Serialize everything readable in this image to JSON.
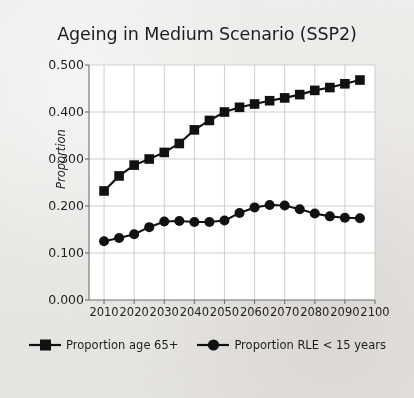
{
  "figure": {
    "background_color": "#ebe9e6",
    "plot_background_color": "#ffffff",
    "ink_color": "#111111",
    "grid_color": "#c9c9c9"
  },
  "chart_data": {
    "type": "line",
    "title": "Ageing in Medium Scenario (SSP2)",
    "xlabel": "",
    "ylabel": "Proportion",
    "xlim": [
      2005,
      2100
    ],
    "ylim": [
      0.0,
      0.5
    ],
    "xticks": [
      2010,
      2020,
      2030,
      2040,
      2050,
      2060,
      2070,
      2080,
      2090,
      2100
    ],
    "xtick_labels": [
      "2010",
      "2020",
      "2030",
      "2040",
      "2050",
      "2060",
      "2070",
      "2080",
      "2090",
      "2100"
    ],
    "yticks": [
      0.0,
      0.1,
      0.2,
      0.3,
      0.4,
      0.5
    ],
    "ytick_labels": [
      "0.000",
      "0.100",
      "0.200",
      "0.300",
      "0.400",
      "0.500"
    ],
    "grid": true,
    "legend_position": "below",
    "x": [
      2010,
      2015,
      2020,
      2025,
      2030,
      2035,
      2040,
      2045,
      2050,
      2055,
      2060,
      2065,
      2070,
      2075,
      2080,
      2085,
      2090,
      2095
    ],
    "series": [
      {
        "name": "Proportion age 65+",
        "marker": "square",
        "color": "#111111",
        "values": [
          0.232,
          0.264,
          0.287,
          0.3,
          0.314,
          0.333,
          0.362,
          0.382,
          0.4,
          0.41,
          0.417,
          0.424,
          0.43,
          0.437,
          0.446,
          0.452,
          0.46,
          0.468
        ]
      },
      {
        "name": "Proportion RLE < 15 years",
        "marker": "circle",
        "color": "#111111",
        "values": [
          0.125,
          0.132,
          0.14,
          0.155,
          0.167,
          0.168,
          0.166,
          0.166,
          0.169,
          0.185,
          0.197,
          0.202,
          0.201,
          0.193,
          0.184,
          0.178,
          0.175,
          0.174
        ]
      }
    ]
  },
  "legend": {
    "entries": [
      {
        "label": "Proportion age 65+",
        "marker": "square"
      },
      {
        "label": "Proportion RLE < 15 years",
        "marker": "circle"
      }
    ]
  }
}
